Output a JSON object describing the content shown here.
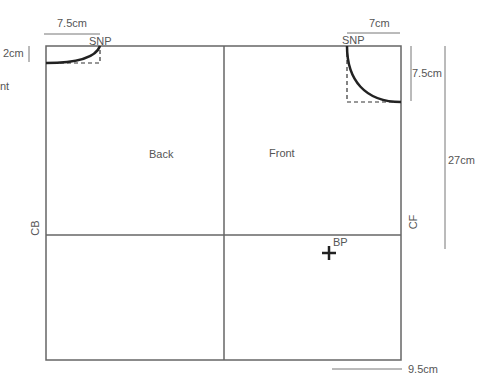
{
  "diagram": {
    "panels": {
      "back_label": "Back",
      "front_label": "Front"
    },
    "edge_labels": {
      "center_back": "CB",
      "center_front": "CF"
    },
    "points": {
      "shoulder_neck_point_back": "SNP",
      "shoulder_neck_point_front": "SNP",
      "bust_point": "BP"
    },
    "measurements": {
      "back_neck_width": "7.5cm",
      "back_neck_depth": "2cm",
      "front_neck_width": "7cm",
      "front_neck_depth": "7.5cm",
      "cf_to_bust_depth": "27cm",
      "bust_point_from_cf": "9.5cm"
    },
    "cropped_text": "nt",
    "colors": {
      "outline": "#555555",
      "neckline": "#222222",
      "guide": "#666666"
    }
  }
}
